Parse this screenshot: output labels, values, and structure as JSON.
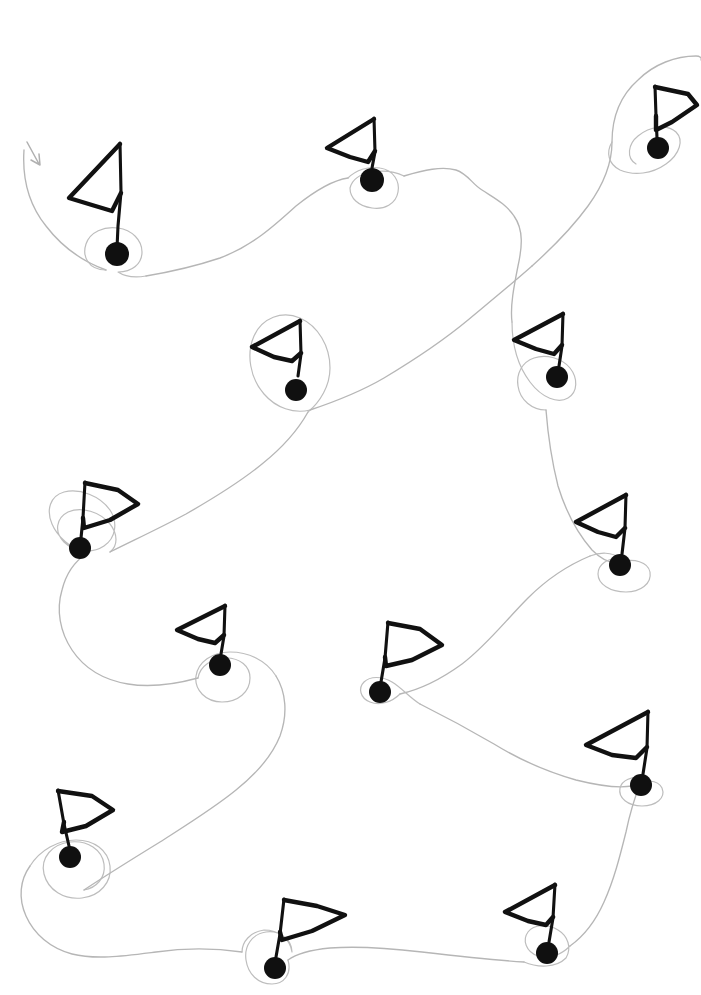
{
  "document": {
    "title": "Hand-drawn Flag Route Sketch",
    "width": 701,
    "height": 995,
    "background_color": "#ffffff",
    "description": "Hand-drawn sketch of thirteen triangular flags on poles with filled round bases, linked in sequence by a single faint pencil route that loops around each base. A small arrowhead at the upper left marks the start of the route."
  },
  "style": {
    "flag_stroke_color": "#111111",
    "dot_fill_color": "#101010",
    "route_stroke_color": "#b6b6b6",
    "loop_stroke_color": "#bdbdbd",
    "arrow_stroke_color": "#b0b0b0",
    "flag_stroke_width": 4.4,
    "pole_stroke_width": 3.1,
    "route_stroke_width": 1.35
  },
  "legend": {
    "flag_icon_name": "flag-icon",
    "dot_icon_name": "waypoint-dot-icon",
    "route_icon_name": "route-path-icon",
    "arrow_icon_name": "start-arrow-icon",
    "flag_count_label": "13 flags",
    "route_label": "single continuous route",
    "start_label": "start"
  },
  "chart_data": {
    "type": "scatter",
    "title": "Hand-drawn Flag Route Sketch",
    "subtitle": "Thirteen flag waypoints joined by one continuous looping route",
    "xlabel": "",
    "ylabel": "",
    "xlim": [
      0,
      701
    ],
    "ylim": [
      0,
      995
    ],
    "grid": false,
    "legend_position": "none",
    "marker": "flag-on-pole-with-filled-dot",
    "point_count": 13,
    "route_order": [
      1,
      2,
      3,
      4,
      5,
      6,
      7,
      8,
      9,
      10,
      11,
      12,
      13
    ],
    "start_marker": "arrowhead at upper-left",
    "categories": [
      "flag-1",
      "flag-2",
      "flag-3",
      "flag-4",
      "flag-5",
      "flag-6",
      "flag-7",
      "flag-8",
      "flag-9",
      "flag-10",
      "flag-11",
      "flag-12",
      "flag-13"
    ],
    "points": [
      {
        "id": "flag-1",
        "label": "1",
        "x": 117,
        "y": 254,
        "flag_direction": "left",
        "pole_height": 90,
        "flag_width": 55,
        "loop_radius": 30
      },
      {
        "id": "flag-2",
        "label": "2",
        "x": 372,
        "y": 180,
        "flag_direction": "left",
        "pole_height": 62,
        "flag_width": 50,
        "loop_radius": 28
      },
      {
        "id": "flag-3",
        "label": "3",
        "x": 658,
        "y": 148,
        "flag_direction": "right",
        "pole_height": 62,
        "flag_width": 44,
        "loop_radius": 28
      },
      {
        "id": "flag-4",
        "label": "4",
        "x": 296,
        "y": 390,
        "flag_direction": "left",
        "pole_height": 72,
        "flag_width": 48,
        "loop_radius": 44
      },
      {
        "id": "flag-5",
        "label": "5",
        "x": 557,
        "y": 377,
        "flag_direction": "left",
        "pole_height": 70,
        "flag_width": 48,
        "loop_radius": 33
      },
      {
        "id": "flag-6",
        "label": "6",
        "x": 80,
        "y": 548,
        "flag_direction": "right",
        "pole_height": 66,
        "flag_width": 54,
        "loop_radius": 36
      },
      {
        "id": "flag-7",
        "label": "7",
        "x": 620,
        "y": 565,
        "flag_direction": "left",
        "pole_height": 70,
        "flag_width": 52,
        "loop_radius": 30
      },
      {
        "id": "flag-8",
        "label": "8",
        "x": 220,
        "y": 665,
        "flag_direction": "left",
        "pole_height": 58,
        "flag_width": 48,
        "loop_radius": 30
      },
      {
        "id": "flag-9",
        "label": "9",
        "x": 380,
        "y": 692,
        "flag_direction": "right",
        "pole_height": 68,
        "flag_width": 52,
        "loop_radius": 27
      },
      {
        "id": "flag-10",
        "label": "10",
        "x": 641,
        "y": 785,
        "flag_direction": "left",
        "pole_height": 72,
        "flag_width": 58,
        "loop_radius": 26
      },
      {
        "id": "flag-11",
        "label": "11",
        "x": 70,
        "y": 857,
        "flag_direction": "right",
        "pole_height": 66,
        "flag_width": 54,
        "loop_radius": 38
      },
      {
        "id": "flag-12",
        "label": "12",
        "x": 275,
        "y": 968,
        "flag_direction": "right",
        "pole_height": 66,
        "flag_width": 55,
        "loop_radius": 30
      },
      {
        "id": "flag-13",
        "label": "13",
        "x": 547,
        "y": 953,
        "flag_direction": "left",
        "pole_height": 66,
        "flag_width": 52,
        "loop_radius": 26
      }
    ]
  }
}
